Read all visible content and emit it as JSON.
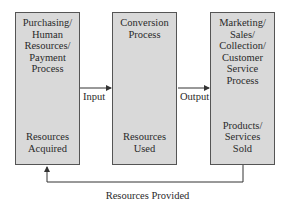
{
  "diagram": {
    "boxes": [
      {
        "id": "box1",
        "title": "Purchasing/\nHuman\nResources/\nPayment\nProcess",
        "bottom": "Resources\nAcquired"
      },
      {
        "id": "box2",
        "title": "Conversion\nProcess",
        "bottom": "Resources\nUsed"
      },
      {
        "id": "box3",
        "title": "Marketing/\nSales/\nCollection/\nCustomer\nService\nProcess",
        "bottom": "Products/\nServices\nSold"
      }
    ],
    "arrows": {
      "input_label": "Input",
      "output_label": "Output",
      "feedback_label": "Resources Provided"
    },
    "colors": {
      "box_fill": "#d9d9d9",
      "box_border": "#555555",
      "line": "#333333"
    }
  }
}
